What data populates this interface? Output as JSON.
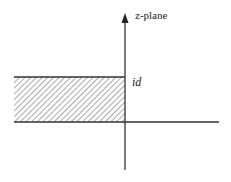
{
  "diagram": {
    "plane_label": "z-plane",
    "height_label": "id",
    "region": {
      "description": "hatched semi-infinite strip",
      "x_from": "-infinity",
      "x_to": 0,
      "y_from": 0,
      "y_to": "d"
    },
    "colors": {
      "axis": "#333333",
      "hatch": "#555555",
      "background": "#ffffff"
    }
  }
}
